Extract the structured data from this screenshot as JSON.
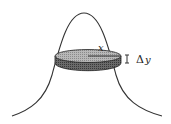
{
  "diagram": {
    "labels": {
      "radius": "x",
      "thickness_delta": "Δ",
      "thickness_var": "y"
    },
    "colors": {
      "curve": "#333333",
      "disk_top": "#b0b0b0",
      "disk_side": "#555555",
      "background": "#ffffff"
    }
  }
}
